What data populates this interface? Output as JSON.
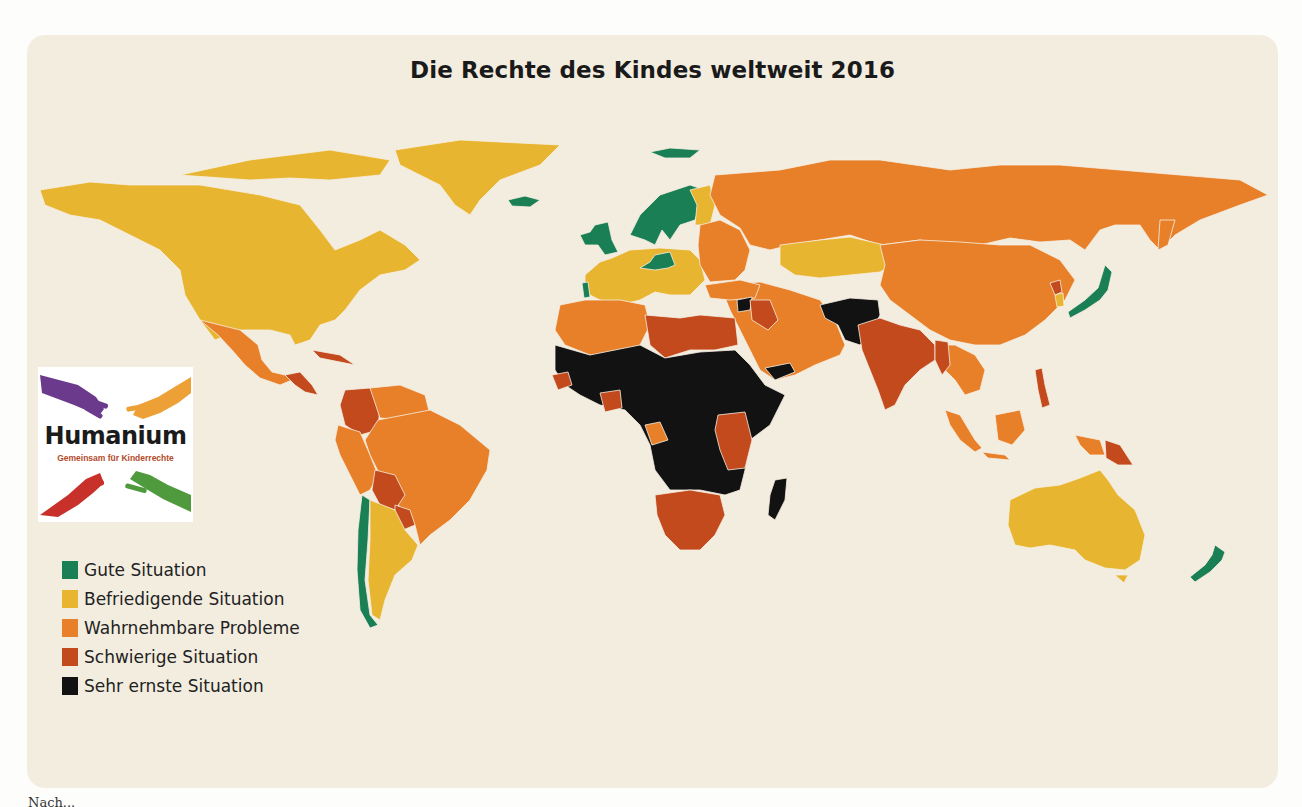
{
  "title": "Die Rechte des Kindes weltweit 2016",
  "colors": {
    "card_bg": "#f3ede0",
    "gute": "#1a7f55",
    "befriedigend": "#e8b530",
    "wahrnehmbar": "#e8802a",
    "schwierig": "#c24a1c",
    "sehr_ernst": "#121212"
  },
  "legend": [
    {
      "label": "Gute Situation",
      "color": "#1a7f55"
    },
    {
      "label": "Befriedigende Situation",
      "color": "#e8b530"
    },
    {
      "label": "Wahrnehmbare Probleme",
      "color": "#e8802a"
    },
    {
      "label": "Schwierige Situation",
      "color": "#c24a1c"
    },
    {
      "label": "Sehr ernste Situation",
      "color": "#121212"
    }
  ],
  "logo": {
    "brand": "Humanium",
    "tagline": "Gemeinsam für Kinderrechte"
  },
  "caption": "Nach...",
  "chart_data": {
    "type": "choropleth",
    "title": "Die Rechte des Kindes weltweit 2016",
    "legend_position": "bottom-left",
    "categories": [
      "Gute Situation",
      "Befriedigende Situation",
      "Wahrnehmbare Probleme",
      "Schwierige Situation",
      "Sehr ernste Situation"
    ],
    "regions": [
      {
        "name": "Canada",
        "category": "Befriedigende Situation"
      },
      {
        "name": "United States",
        "category": "Befriedigende Situation"
      },
      {
        "name": "Greenland",
        "category": "Befriedigende Situation"
      },
      {
        "name": "Iceland",
        "category": "Gute Situation"
      },
      {
        "name": "Mexico",
        "category": "Wahrnehmbare Probleme"
      },
      {
        "name": "Central America",
        "category": "Schwierige Situation"
      },
      {
        "name": "Colombia",
        "category": "Schwierige Situation"
      },
      {
        "name": "Venezuela",
        "category": "Wahrnehmbare Probleme"
      },
      {
        "name": "Brazil",
        "category": "Wahrnehmbare Probleme"
      },
      {
        "name": "Peru",
        "category": "Wahrnehmbare Probleme"
      },
      {
        "name": "Bolivia",
        "category": "Schwierige Situation"
      },
      {
        "name": "Paraguay",
        "category": "Schwierige Situation"
      },
      {
        "name": "Chile",
        "category": "Gute Situation"
      },
      {
        "name": "Argentina",
        "category": "Befriedigende Situation"
      },
      {
        "name": "Uruguay",
        "category": "Befriedigende Situation"
      },
      {
        "name": "Norway/Sweden/Finland",
        "category": "Gute Situation"
      },
      {
        "name": "United Kingdom/Ireland",
        "category": "Gute Situation"
      },
      {
        "name": "Portugal",
        "category": "Gute Situation"
      },
      {
        "name": "Germany/Austria",
        "category": "Gute Situation"
      },
      {
        "name": "Western/Central Europe",
        "category": "Befriedigende Situation"
      },
      {
        "name": "Eastern Europe",
        "category": "Wahrnehmbare Probleme"
      },
      {
        "name": "Russia",
        "category": "Wahrnehmbare Probleme"
      },
      {
        "name": "Kazakhstan",
        "category": "Befriedigende Situation"
      },
      {
        "name": "China/Mongolia",
        "category": "Wahrnehmbare Probleme"
      },
      {
        "name": "Japan",
        "category": "Gute Situation"
      },
      {
        "name": "South Korea",
        "category": "Befriedigende Situation"
      },
      {
        "name": "North Korea",
        "category": "Schwierige Situation"
      },
      {
        "name": "India",
        "category": "Schwierige Situation"
      },
      {
        "name": "Afghanistan/Pakistan",
        "category": "Sehr ernste Situation"
      },
      {
        "name": "Iran/Arabian Peninsula",
        "category": "Wahrnehmbare Probleme"
      },
      {
        "name": "Syria",
        "category": "Sehr ernste Situation"
      },
      {
        "name": "Iraq",
        "category": "Schwierige Situation"
      },
      {
        "name": "Yemen",
        "category": "Sehr ernste Situation"
      },
      {
        "name": "North Africa (Morocco/Algeria)",
        "category": "Wahrnehmbare Probleme"
      },
      {
        "name": "Libya/Egypt",
        "category": "Schwierige Situation"
      },
      {
        "name": "Sub-Saharan Africa",
        "category": "Sehr ernste Situation"
      },
      {
        "name": "Kenya/Tanzania/Uganda",
        "category": "Schwierige Situation"
      },
      {
        "name": "Southern Africa",
        "category": "Schwierige Situation"
      },
      {
        "name": "Madagascar",
        "category": "Sehr ernste Situation"
      },
      {
        "name": "Southeast Asia",
        "category": "Wahrnehmbare Probleme"
      },
      {
        "name": "Indonesia",
        "category": "Wahrnehmbare Probleme"
      },
      {
        "name": "Papua New Guinea",
        "category": "Schwierige Situation"
      },
      {
        "name": "Australia",
        "category": "Befriedigende Situation"
      },
      {
        "name": "New Zealand",
        "category": "Gute Situation"
      }
    ]
  },
  "map_shapes": [
    {
      "id": "greenland",
      "c": "befriedigend",
      "d": "M395,150 L460,140 L560,145 L540,165 L500,180 L480,200 L470,215 L455,205 L440,185 L420,175 L400,165 Z"
    },
    {
      "id": "canada-arctic",
      "c": "befriedigend",
      "d": "M180,175 L250,160 L330,150 L390,160 L380,175 L330,180 L290,178 L250,180 Z"
    },
    {
      "id": "north-america",
      "c": "befriedigend",
      "d": "M40,190 L90,182 L130,185 L200,185 L260,195 L300,205 L320,230 L335,250 L360,240 L380,230 L405,245 L420,260 L405,270 L380,275 L360,290 L345,310 L335,320 L320,325 L310,340 L295,345 L290,335 L270,330 L240,330 L215,340 L200,320 L185,295 L180,270 L160,250 L130,235 L100,220 L70,215 L45,205 Z"
    },
    {
      "id": "iceland",
      "c": "gute",
      "d": "M508,200 L525,196 L540,200 L530,207 L512,206 Z"
    },
    {
      "id": "mexico",
      "c": "wahrnehmbar",
      "d": "M200,320 L240,330 L258,345 L262,360 L272,372 L285,375 L292,380 L280,385 L260,378 L245,365 L232,350 L218,335 Z"
    },
    {
      "id": "central-america",
      "c": "schwierig",
      "d": "M285,375 L300,372 L312,385 L318,395 L305,392 L295,385 Z"
    },
    {
      "id": "caribbean",
      "c": "schwierig",
      "d": "M312,350 L340,355 L355,365 L340,362 L320,358 Z"
    },
    {
      "id": "colombia",
      "c": "schwierig",
      "d": "M345,390 L370,388 L380,405 L378,430 L360,435 L345,425 L340,405 Z"
    },
    {
      "id": "venezuela-guianas",
      "c": "wahrnehmbar",
      "d": "M370,388 L400,385 L425,395 L430,415 L405,420 L380,418 Z"
    },
    {
      "id": "brazil",
      "c": "wahrnehmbar",
      "d": "M378,420 L430,410 L460,425 L490,450 L487,470 L470,500 L450,520 L430,535 L420,545 L415,525 L400,510 L395,490 L380,475 L370,455 L365,440 Z"
    },
    {
      "id": "peru-ecuador",
      "c": "wahrnehmbar",
      "d": "M338,425 L360,432 L370,455 L378,475 L370,490 L360,495 L350,475 L340,455 L335,440 Z"
    },
    {
      "id": "bolivia",
      "c": "schwierig",
      "d": "M375,470 L395,475 L405,495 L395,510 L380,505 L372,490 Z"
    },
    {
      "id": "paraguay",
      "c": "schwierig",
      "d": "M395,505 L410,510 L415,525 L403,530 L395,518 Z"
    },
    {
      "id": "chile",
      "c": "gute",
      "d": "M362,495 L370,500 L368,540 L365,580 L370,615 L378,625 L370,628 L360,610 L357,570 L358,530 Z"
    },
    {
      "id": "argentina",
      "c": "befriedigend",
      "d": "M370,500 L395,510 L405,530 L418,545 L412,560 L395,575 L385,600 L380,620 L372,615 L368,580 L370,540 Z"
    },
    {
      "id": "scandinavia",
      "c": "gute",
      "d": "M630,235 L640,215 L660,195 L690,185 L705,190 L700,205 L695,220 L680,225 L670,240 L662,230 L655,245 L645,240 Z"
    },
    {
      "id": "finland",
      "c": "befriedigend",
      "d": "M690,190 L710,185 L715,205 L710,225 L695,225 L697,205 Z"
    },
    {
      "id": "uk-ireland",
      "c": "gute",
      "d": "M595,225 L608,222 L612,240 L618,252 L605,255 L598,245 L585,245 L580,235 L590,232 Z"
    },
    {
      "id": "svalbard",
      "c": "gute",
      "d": "M650,152 L670,148 L700,150 L690,158 L665,158 Z"
    },
    {
      "id": "western-europe",
      "c": "befriedigend",
      "d": "M585,275 L600,262 L612,258 L630,250 L660,248 L690,250 L700,260 L705,280 L690,295 L670,295 L655,292 L640,300 L620,305 L600,300 L590,295 L585,285 Z"
    },
    {
      "id": "portugal",
      "c": "gute",
      "d": "M582,283 L588,282 L590,297 L584,298 Z"
    },
    {
      "id": "germany-austria",
      "c": "gute",
      "d": "M655,255 L670,252 L675,265 L668,268 L655,270 L640,268 L650,262 Z"
    },
    {
      "id": "eastern-europe",
      "c": "wahrnehmbar",
      "d": "M700,225 L720,220 L740,230 L750,250 L745,270 L735,280 L710,282 L700,265 L698,245 Z"
    },
    {
      "id": "russia",
      "c": "wahrnehmbar",
      "d": "M715,175 L780,170 L830,160 L880,160 L950,170 L1000,165 L1060,165 L1120,170 L1180,175 L1240,180 L1268,195 L1240,205 L1200,220 L1175,235 L1160,250 L1150,240 L1140,225 L1115,225 L1100,230 L1085,250 L1070,240 L1040,242 L1010,238 L980,245 L945,245 L920,240 L880,245 L850,235 L820,240 L790,245 L770,250 L750,245 L740,228 L720,215 L710,195 Z"
    },
    {
      "id": "kamchatka",
      "c": "wahrnehmbar",
      "d": "M1160,220 L1175,220 L1168,245 L1158,250 Z"
    },
    {
      "id": "kazakhstan-central-asia",
      "c": "befriedigend",
      "d": "M780,245 L820,240 L850,237 L885,245 L900,260 L880,272 L850,275 L820,278 L795,275 L780,265 Z"
    },
    {
      "id": "china-mongolia",
      "c": "wahrnehmbar",
      "d": "M880,245 L920,240 L960,242 L1000,245 L1030,245 L1060,260 L1075,280 L1065,300 L1045,320 L1025,335 L1000,345 L975,345 L950,340 L930,330 L910,315 L890,300 L880,285 L885,265 Z"
    },
    {
      "id": "korea-north",
      "c": "schwierig",
      "d": "M1050,283 L1060,280 L1062,292 L1055,295 Z"
    },
    {
      "id": "korea-south",
      "c": "befriedigend",
      "d": "M1055,295 L1063,293 L1064,306 L1057,307 Z"
    },
    {
      "id": "japan",
      "c": "gute",
      "d": "M1105,265 L1112,272 L1108,290 L1100,300 L1085,310 L1070,318 L1068,312 L1085,300 L1098,288 L1102,275 Z"
    },
    {
      "id": "caucasus-iran-arabia",
      "c": "wahrnehmbar",
      "d": "M720,285 L760,282 L790,290 L820,300 L835,320 L845,345 L840,355 L815,365 L795,375 L775,380 L760,370 L750,350 L740,330 L730,310 Z"
    },
    {
      "id": "turkey",
      "c": "wahrnehmbar",
      "d": "M705,285 L740,280 L760,285 L755,298 L730,300 L710,298 Z"
    },
    {
      "id": "syria",
      "c": "sehr_ernst",
      "d": "M737,300 L752,297 L750,310 L738,312 Z"
    },
    {
      "id": "iraq",
      "c": "schwierig",
      "d": "M750,300 L770,300 L778,320 L768,330 L752,320 Z"
    },
    {
      "id": "yemen",
      "c": "sehr_ernst",
      "d": "M765,368 L790,363 L795,372 L775,380 Z"
    },
    {
      "id": "afghanistan-pakistan",
      "c": "sehr_ernst",
      "d": "M820,305 L850,298 L878,300 L880,315 L870,335 L860,345 L845,340 L838,325 L825,318 Z"
    },
    {
      "id": "india-region",
      "c": "schwierig",
      "d": "M858,325 L880,318 L900,325 L920,330 L935,345 L935,360 L920,370 L905,385 L895,405 L885,410 L878,390 L870,370 L862,350 Z"
    },
    {
      "id": "southeast-asia",
      "c": "wahrnehmbar",
      "d": "M935,345 L955,345 L975,355 L985,370 L980,390 L965,395 L955,380 L945,370 L938,360 Z"
    },
    {
      "id": "myanmar",
      "c": "schwierig",
      "d": "M935,340 L948,342 L950,365 L942,375 L935,360 Z"
    },
    {
      "id": "philippines",
      "c": "schwierig",
      "d": "M1035,370 L1042,368 L1045,385 L1050,405 L1042,408 L1038,390 Z"
    },
    {
      "id": "sumatra",
      "c": "wahrnehmbar",
      "d": "M945,410 L960,415 L975,440 L982,448 L975,452 L960,440 L950,425 Z"
    },
    {
      "id": "borneo",
      "c": "wahrnehmbar",
      "d": "M995,415 L1020,410 L1025,430 L1012,445 L998,440 Z"
    },
    {
      "id": "java",
      "c": "wahrnehmbar",
      "d": "M982,452 L1005,455 L1010,460 L988,458 Z"
    },
    {
      "id": "new-guinea-west",
      "c": "wahrnehmbar",
      "d": "M1075,435 L1100,440 L1105,455 L1090,455 L1080,445 Z"
    },
    {
      "id": "papua-new-guinea",
      "c": "schwierig",
      "d": "M1105,440 L1120,445 L1133,465 L1118,465 L1106,458 Z"
    },
    {
      "id": "australia",
      "c": "befriedigend",
      "d": "M1010,500 L1035,488 L1060,485 L1080,478 L1100,470 L1108,480 L1118,495 L1135,510 L1145,535 L1140,560 L1125,570 L1105,568 L1085,560 L1075,550 L1050,545 L1030,548 L1015,545 L1008,525 Z"
    },
    {
      "id": "tasmania",
      "c": "befriedigend",
      "d": "M1115,575 L1128,575 L1124,583 Z"
    },
    {
      "id": "new-zealand",
      "c": "gute",
      "d": "M1215,545 L1225,552 L1222,560 L1210,572 L1195,582 L1190,577 L1205,565 L1212,555 Z"
    },
    {
      "id": "north-africa-west",
      "c": "wahrnehmbar",
      "d": "M560,305 L585,300 L620,300 L645,305 L650,325 L640,345 L620,355 L590,355 L565,345 L555,330 Z"
    },
    {
      "id": "libya-egypt",
      "c": "schwierig",
      "d": "M645,315 L680,318 L700,315 L735,318 L738,345 L715,350 L690,350 L665,358 L650,345 Z"
    },
    {
      "id": "sub-saharan-africa",
      "c": "sehr_ernst",
      "d": "M555,345 L590,355 L640,345 L665,358 L700,352 L735,350 L750,365 L765,385 L785,395 L770,425 L750,440 L745,470 L740,490 L725,495 L700,490 L670,490 L655,470 L650,445 L640,425 L625,410 L600,405 L580,395 L565,385 L555,370 Z"
    },
    {
      "id": "senegal",
      "c": "schwierig",
      "d": "M552,375 L568,372 L572,385 L558,390 Z"
    },
    {
      "id": "ghana-ivory",
      "c": "schwierig",
      "d": "M600,393 L620,390 L622,408 L605,412 Z"
    },
    {
      "id": "congo",
      "c": "wahrnehmbar",
      "d": "M645,425 L660,422 L668,440 L652,445 Z"
    },
    {
      "id": "east-africa-kenya-tanzania",
      "c": "schwierig",
      "d": "M718,415 L745,412 L752,440 L745,468 L728,470 L720,450 L715,430 Z"
    },
    {
      "id": "southern-africa",
      "c": "schwierig",
      "d": "M655,495 L690,490 L720,495 L725,515 L715,535 L700,550 L680,550 L665,535 L657,515 Z"
    },
    {
      "id": "madagascar",
      "c": "sehr_ernst",
      "d": "M775,480 L787,478 L785,500 L775,520 L768,515 L770,495 Z"
    }
  ]
}
